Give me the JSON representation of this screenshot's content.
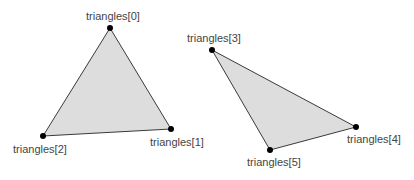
{
  "diagram": {
    "width": 414,
    "height": 180,
    "colors": {
      "fill": "#dddddd",
      "stroke": "#3a3a3a",
      "vertex": "#000000",
      "label": "#444444"
    },
    "triangles": [
      {
        "id": "triangle-a",
        "vertices": [
          {
            "label": "triangles[0]",
            "x": 110,
            "y": 28,
            "label_x": 86,
            "label_y": 20
          },
          {
            "label": "triangles[1]",
            "x": 171,
            "y": 129,
            "label_x": 150,
            "label_y": 146
          },
          {
            "label": "triangles[2]",
            "x": 43,
            "y": 136,
            "label_x": 13,
            "label_y": 153
          }
        ]
      },
      {
        "id": "triangle-b",
        "vertices": [
          {
            "label": "triangles[3]",
            "x": 212,
            "y": 50,
            "label_x": 187,
            "label_y": 42
          },
          {
            "label": "triangles[4]",
            "x": 356,
            "y": 127,
            "label_x": 347,
            "label_y": 143
          },
          {
            "label": "triangles[5]",
            "x": 270,
            "y": 150,
            "label_x": 247,
            "label_y": 166
          }
        ]
      }
    ]
  }
}
